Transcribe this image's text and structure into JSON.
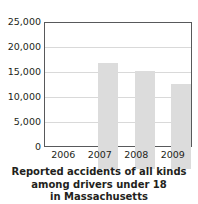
{
  "chart_data": {
    "type": "bar",
    "title": "",
    "caption_lines": [
      "Reported accidents of all kinds",
      "among drivers under 18",
      "in Massachusetts"
    ],
    "categories": [
      "2006",
      "2007",
      "2008",
      "2009"
    ],
    "values": [
      21500,
      20000,
      17200,
      13400
    ],
    "series": [
      {
        "name": "Reported accidents",
        "values": [
          21500,
          20000,
          17200,
          13400
        ]
      }
    ],
    "xlabel": "",
    "ylabel": "",
    "ylim": [
      0,
      25000
    ],
    "ytick_values": [
      25000,
      20000,
      15000,
      10000,
      5000,
      0
    ],
    "ytick_labels": [
      "25,000",
      "20,000",
      "15,000",
      "10,000",
      "5,000",
      "0"
    ],
    "grid": true,
    "grid_axis": "y",
    "legend": false,
    "legend_position": "none",
    "bar_color": "#dcdcdc",
    "grid_color": "#d9d9d9",
    "axis_color": "#58595b",
    "text_color": "#231f20"
  }
}
